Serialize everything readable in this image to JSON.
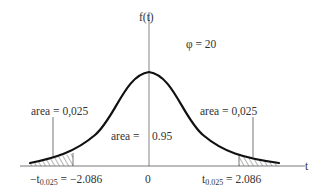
{
  "diagram": {
    "y_axis_label": "f(t)",
    "x_axis_label": "t",
    "parameter": "φ = 20",
    "left_tail_area": "area = 0,025",
    "right_tail_area": "area = 0,025",
    "center_area_label": "area =",
    "center_area_value": "0.95",
    "left_crit_prefix": "−t",
    "left_crit_sub": "0.025",
    "left_crit_value": " = −2.086",
    "origin": "0",
    "right_crit_prefix": "t",
    "right_crit_sub": "0.025",
    "right_crit_value": " = 2.086",
    "colors": {
      "curve": "#111111",
      "axis": "#555555",
      "hatch": "#444444"
    }
  }
}
